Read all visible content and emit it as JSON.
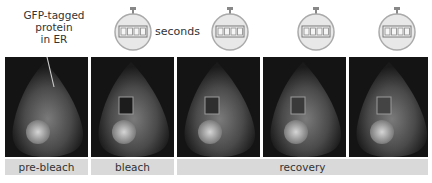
{
  "annotation": {
    "lines": [
      "GFP-tagged",
      "protein",
      "in ER"
    ]
  },
  "timer_unit_label": "seconds",
  "stopwatches": [
    {
      "digits": "0000"
    },
    {
      "digits": "0063"
    },
    {
      "digits": "0412"
    },
    {
      "digits": "0400"
    },
    {
      "digits": "0000"
    }
  ],
  "panels": [
    {
      "stage": "pre-bleach",
      "bleach_box": false
    },
    {
      "stage": "bleach",
      "bleach_box": true,
      "box_dark": true
    },
    {
      "stage": "recovery",
      "bleach_box": true,
      "box_dark": false
    },
    {
      "stage": "recovery",
      "bleach_box": true,
      "box_dark": false
    },
    {
      "stage": "recovery",
      "bleach_box": true,
      "box_dark": false
    }
  ],
  "stage_labels": {
    "pre_bleach": "pre-bleach",
    "bleach": "bleach",
    "recovery": "recovery"
  },
  "colors": {
    "panel_bg": "#141414",
    "label_bg": "#d9d9d9",
    "box_outline": "#9a9a9a"
  }
}
